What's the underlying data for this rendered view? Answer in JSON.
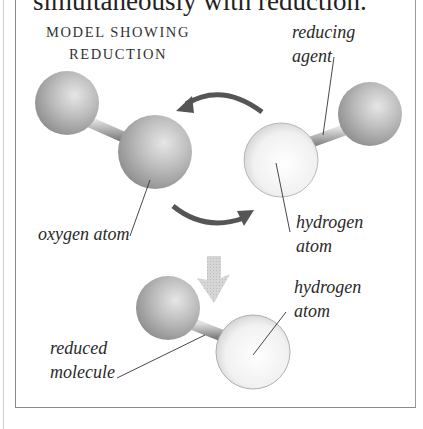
{
  "lead_text": "simultaneously with reduction.",
  "title": {
    "line1": "MODEL SHOWING",
    "line2": "REDUCTION"
  },
  "labels": {
    "reducing_agent": [
      "reducing",
      "agent"
    ],
    "oxygen_atom": "oxygen atom",
    "hydrogen_atom_top": [
      "hydrogen",
      "atom"
    ],
    "hydrogen_atom_bottom": [
      "hydrogen",
      "atom"
    ],
    "reduced_molecule": [
      "reduced",
      "molecule"
    ]
  },
  "colors": {
    "oxygen_sphere": "#b5b5b5",
    "hydrogen_sphere": "#f2f2f2",
    "arrow": "#555555",
    "down_arrow": "#c8c8c8",
    "border": "#8a8a8a"
  }
}
